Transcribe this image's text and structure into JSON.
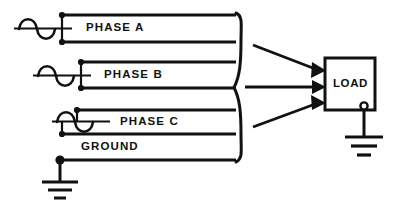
{
  "diagram": {
    "colors": {
      "line": "#111111",
      "background": "#ffffff"
    },
    "labels": {
      "phase_a": "PHASE A",
      "phase_b": "PHASE B",
      "phase_c": "PHASE C",
      "ground": "GROUND",
      "load": "LOAD"
    },
    "conductors": [
      {
        "name": "phase-a-line-1",
        "y": 15
      },
      {
        "name": "phase-a-line-2",
        "y": 42
      },
      {
        "name": "phase-b-line-1",
        "y": 62
      },
      {
        "name": "phase-b-line-2",
        "y": 88
      },
      {
        "name": "phase-c-line-1",
        "y": 110
      },
      {
        "name": "phase-c-line-2",
        "y": 134
      },
      {
        "name": "ground-line",
        "y": 160
      }
    ],
    "sources": [
      {
        "name": "phase-a-generator",
        "x": 14,
        "y": 28
      },
      {
        "name": "phase-b-generator",
        "x": 33,
        "y": 75
      },
      {
        "name": "phase-c-generator",
        "x": 52,
        "y": 122
      }
    ],
    "load_box": {
      "x": 325,
      "y": 58,
      "width": 50,
      "height": 52
    },
    "feeders": 3,
    "ground_symbols": 2,
    "brace": {
      "x": 240,
      "top": 12,
      "bottom": 163
    }
  }
}
